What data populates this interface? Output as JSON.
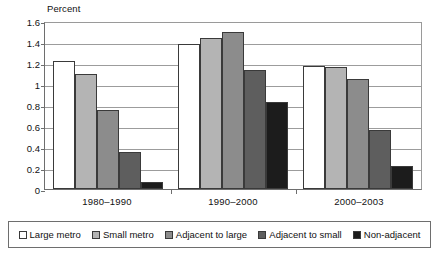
{
  "chart_data": {
    "type": "bar",
    "title": "",
    "subtitle": "",
    "xlabel": "",
    "ylabel": "Percent",
    "ylim": [
      0,
      1.6
    ],
    "ytick_labels": [
      "1.6",
      "1.4",
      "1.2",
      "1",
      "0.8",
      "0.6",
      "0.4",
      "0.2",
      "0"
    ],
    "ytick_values": [
      1.6,
      1.4,
      1.2,
      1.0,
      0.8,
      0.6,
      0.4,
      0.2,
      0
    ],
    "grid": true,
    "legend_position": "bottom",
    "categories": [
      "1980–1990",
      "1990–2000",
      "2000–2003"
    ],
    "series": [
      {
        "name": "Large metro",
        "color": "#ffffff",
        "values": [
          1.22,
          1.38,
          1.17
        ]
      },
      {
        "name": "Small metro",
        "color": "#b4b4b4",
        "values": [
          1.1,
          1.44,
          1.16
        ]
      },
      {
        "name": "Adjacent to large",
        "color": "#8c8c8c",
        "values": [
          0.75,
          1.5,
          1.05
        ]
      },
      {
        "name": "Adjacent to small",
        "color": "#5e5e5e",
        "values": [
          0.35,
          1.13,
          0.56
        ]
      },
      {
        "name": "Non-adjacent",
        "color": "#1c1c1c",
        "values": [
          0.07,
          0.83,
          0.22
        ]
      }
    ]
  },
  "legend": {
    "items": [
      {
        "label": "Large metro"
      },
      {
        "label": "Small metro"
      },
      {
        "label": "Adjacent to large"
      },
      {
        "label": "Adjacent to small"
      },
      {
        "label": "Non-adjacent"
      }
    ]
  }
}
